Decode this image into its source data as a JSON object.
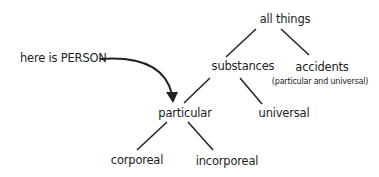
{
  "diagram": {
    "type": "tree",
    "callout": {
      "text": "here is PERSON",
      "points_to": "particular"
    },
    "nodes": {
      "all_things": {
        "label": "all things"
      },
      "substances": {
        "label": "substances"
      },
      "accidents": {
        "label": "accidents",
        "note": "(particular and universal)"
      },
      "particular": {
        "label": "particular"
      },
      "universal": {
        "label": "universal"
      },
      "corporeal": {
        "label": "corporeal"
      },
      "incorporeal": {
        "label": "incorporeal"
      }
    },
    "edges": [
      [
        "all things",
        "substances"
      ],
      [
        "all things",
        "accidents"
      ],
      [
        "substances",
        "particular"
      ],
      [
        "substances",
        "universal"
      ],
      [
        "particular",
        "corporeal"
      ],
      [
        "particular",
        "incorporeal"
      ]
    ],
    "colors": {
      "ink": "#222222",
      "background": "#ffffff"
    }
  }
}
